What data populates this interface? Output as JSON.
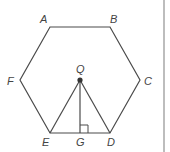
{
  "diagram": {
    "type": "geometry",
    "shape": "regular-hexagon",
    "colors": {
      "line": "#4a4a4a",
      "label": "#444444",
      "center_dot": "#333333",
      "rule": "#bdbdbd"
    },
    "vertices": {
      "A": {
        "label": "A",
        "x": 50,
        "y": 27
      },
      "B": {
        "label": "B",
        "x": 110,
        "y": 27
      },
      "C": {
        "label": "C",
        "x": 140,
        "y": 80
      },
      "D": {
        "label": "D",
        "x": 110,
        "y": 133
      },
      "E": {
        "label": "E",
        "x": 50,
        "y": 133
      },
      "F": {
        "label": "F",
        "x": 20,
        "y": 80
      }
    },
    "points": {
      "Q": {
        "label": "Q",
        "x": 80,
        "y": 80,
        "role": "center"
      },
      "G": {
        "label": "G",
        "x": 80,
        "y": 133,
        "role": "foot-of-perpendicular"
      }
    },
    "segments": [
      "AB",
      "BC",
      "CD",
      "DE",
      "EF",
      "FA",
      "QE",
      "QD",
      "QG"
    ],
    "annotations": [
      {
        "type": "right-angle",
        "at": "G",
        "between": [
          "QG",
          "GD"
        ]
      }
    ]
  }
}
